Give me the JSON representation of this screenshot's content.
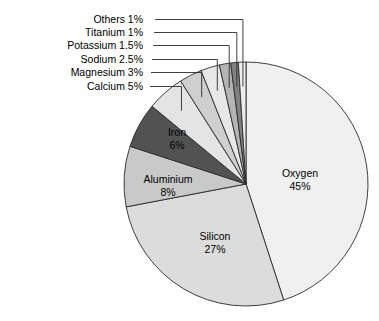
{
  "chart_data": {
    "type": "pie",
    "title": "",
    "subtitle": "",
    "xlabel": "",
    "ylabel": "",
    "legend_position": "none",
    "grid": false,
    "units": "percent",
    "start_angle_deg": 0,
    "direction": "clockwise",
    "categories": [
      "Oxygen",
      "Silicon",
      "Aluminium",
      "Iron",
      "Calcium",
      "Magnesium",
      "Sodium",
      "Potassium",
      "Titanium",
      "Others"
    ],
    "values": [
      45,
      27,
      8,
      6,
      5,
      3,
      2.5,
      1.5,
      1,
      1
    ],
    "slices": [
      {
        "name": "Oxygen",
        "value": 45,
        "label": "Oxygen",
        "value_label": "45%",
        "color": "#f0f0f0",
        "label_placement": "inside",
        "label_x": 300,
        "label_y": 177
      },
      {
        "name": "Silicon",
        "value": 27,
        "label": "Silicon",
        "value_label": "27%",
        "color": "#dcdcdc",
        "label_placement": "inside",
        "label_x": 215,
        "label_y": 240
      },
      {
        "name": "Aluminium",
        "value": 8,
        "label": "Aluminium",
        "value_label": "8%",
        "color": "#c9c9c9",
        "label_placement": "inside",
        "label_x": 168,
        "label_y": 183
      },
      {
        "name": "Iron",
        "value": 6,
        "label": "Iron",
        "value_label": "6%",
        "color": "#525252",
        "label_placement": "inside",
        "label_x": 177,
        "label_y": 136
      },
      {
        "name": "Calcium",
        "value": 5,
        "label": "Calcium",
        "value_label": "5%",
        "color": "#e4e4e4",
        "label_placement": "callout",
        "callout_text": "Calcium 5%"
      },
      {
        "name": "Magnesium",
        "value": 3,
        "label": "Magnesium",
        "value_label": "3%",
        "color": "#cfcfcf",
        "label_placement": "callout",
        "callout_text": "Magnesium 3%"
      },
      {
        "name": "Sodium",
        "value": 2.5,
        "label": "Sodium",
        "value_label": "2.5%",
        "color": "#e8e8e8",
        "label_placement": "callout",
        "callout_text": "Sodium 2.5%"
      },
      {
        "name": "Potassium",
        "value": 1.5,
        "label": "Potassium",
        "value_label": "1.5%",
        "color": "#b4b4b4",
        "label_placement": "callout",
        "callout_text": "Potassium 1.5%"
      },
      {
        "name": "Titanium",
        "value": 1,
        "label": "Titanium",
        "value_label": "1%",
        "color": "#828282",
        "label_placement": "callout",
        "callout_text": "Titanium 1%"
      },
      {
        "name": "Others",
        "value": 1,
        "label": "Others",
        "value_label": "1%",
        "color": "#ededed",
        "label_placement": "callout",
        "callout_text": "Others 1%"
      }
    ],
    "callouts": [
      {
        "name": "Others",
        "text": "Others 1%",
        "text_x": 143,
        "text_y": 23
      },
      {
        "name": "Titanium",
        "text": "Titanium 1%",
        "text_x": 143,
        "text_y": 36
      },
      {
        "name": "Potassium",
        "text": "Potassium 1.5%",
        "text_x": 143,
        "text_y": 49
      },
      {
        "name": "Sodium",
        "text": "Sodium 2.5%",
        "text_x": 143,
        "text_y": 63
      },
      {
        "name": "Magnesium",
        "text": "Magnesium 3%",
        "text_x": 143,
        "text_y": 76
      },
      {
        "name": "Calcium",
        "text": "Calcium 5%",
        "text_x": 143,
        "text_y": 90
      }
    ],
    "geometry": {
      "center_x": 246,
      "center_y": 184,
      "radius": 122
    },
    "colors": {
      "background": "#ffffff",
      "outline": "#2b2b2b",
      "text": "#000000"
    }
  }
}
